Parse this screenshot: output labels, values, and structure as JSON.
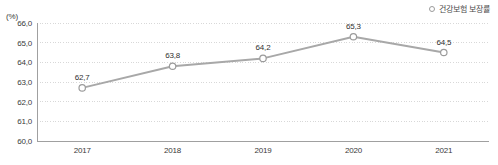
{
  "unit_label": "(%)",
  "legend": {
    "position": "top-right",
    "marker": "open-circle",
    "entries": [
      {
        "label": "건강보험 보장률",
        "color": "#a8a8a8"
      }
    ]
  },
  "colors": {
    "line": "#a8a8a8",
    "marker_stroke": "#9b9b9b",
    "marker_fill": "#ffffff",
    "gridline": "#d8d8d8",
    "axis": "#a0a0a0",
    "text": "#3a3a3a",
    "background": "#ffffff"
  },
  "chart_data": {
    "type": "line",
    "title": "",
    "subtitle": "",
    "xlabel": "",
    "ylabel": "(%)",
    "categories": [
      "2017",
      "2018",
      "2019",
      "2020",
      "2021"
    ],
    "values": [
      62.7,
      63.8,
      64.2,
      65.3,
      64.5
    ],
    "point_labels": [
      "62,7",
      "63,8",
      "64,2",
      "65,3",
      "64,5"
    ],
    "series": [
      {
        "name": "건강보험 보장률",
        "values": [
          62.7,
          63.8,
          64.2,
          65.3,
          64.5
        ]
      }
    ],
    "ylim": [
      60.0,
      66.0
    ],
    "ytick_step": 1.0,
    "ytick_labels": [
      "66,0",
      "65,0",
      "64,0",
      "63,0",
      "62,0",
      "61,0",
      "60,0"
    ],
    "ytick_values": [
      66.0,
      65.0,
      64.0,
      63.0,
      62.0,
      61.0,
      60.0
    ],
    "grid": true,
    "grid_style": "dotted-horizontal",
    "legend_position": "top-right",
    "marker_style": "open-circle"
  }
}
